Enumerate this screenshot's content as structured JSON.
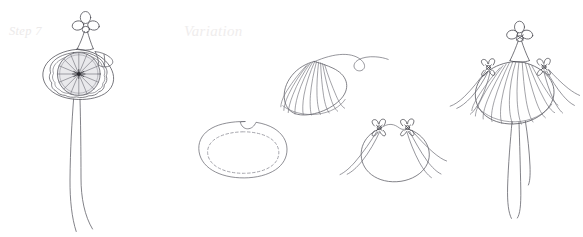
{
  "page": {
    "background_color": "#ffffff",
    "width": 583,
    "height": 237,
    "kind": "craft-instruction-line-drawing"
  },
  "captions": {
    "step_label": "Step 7",
    "variation_label": "Variation",
    "step_label_color": "#eceaea",
    "variation_label_color": "#efeded"
  },
  "ink": {
    "line_color": "#4a4a52",
    "light_line_color": "#8d8d96",
    "fill_color": "#e9e9ec",
    "dash_color": "#9a9aa2"
  },
  "figures": [
    {
      "id": "finished-ornament",
      "name": "Finished gathered yo-yo ornament with bow and streamers",
      "position": "left",
      "parts": [
        "four-loop-bow",
        "neck-cone",
        "gathered-rosette",
        "fabric-skirt",
        "two-long-streamers"
      ]
    },
    {
      "id": "fabric-circle-with-stitch",
      "name": "Flat fabric circle with dashed running stitch",
      "position": "center-left",
      "parts": [
        "outer-circle-with-notch",
        "dashed-running-stitch"
      ]
    },
    {
      "id": "gathered-fan",
      "name": "Gathered pleated fan with trailing thread",
      "position": "center-top",
      "parts": [
        "pleated-dome",
        "radiating-pleat-lines",
        "trailing-thread"
      ]
    },
    {
      "id": "tied-pouch",
      "name": "Rounded pouch tied with two small bows",
      "position": "center-right",
      "parts": [
        "pouch-body",
        "left-bow",
        "right-bow",
        "four-trailing-ties"
      ]
    },
    {
      "id": "variation-ornament",
      "name": "Variation ornament: pleated dome with top bow, side bows and streamers",
      "position": "right",
      "parts": [
        "four-loop-bow",
        "neck-cone",
        "pleated-dome",
        "left-side-bow",
        "right-side-bow",
        "side-ties",
        "two-long-streamers"
      ]
    }
  ]
}
